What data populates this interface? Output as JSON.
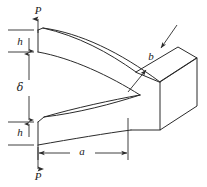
{
  "figure": {
    "type": "engineering-diagram",
    "background_color": "#ffffff",
    "line_color": "#2b2b2b",
    "width": 207,
    "height": 187
  },
  "labels": {
    "load_top": "P",
    "load_bottom": "P",
    "height_top": "h",
    "height_bottom": "h",
    "gap": "δ",
    "length": "a",
    "depth": "b"
  },
  "annotations": [
    {
      "name": "load-top",
      "text": "P",
      "x": 38,
      "y": 11,
      "meaning": "applied force upward at top arm"
    },
    {
      "name": "arm-height-top",
      "text": "h",
      "x": 20,
      "y": 42,
      "meaning": "thickness of upper arm"
    },
    {
      "name": "gap-delta",
      "text": "δ",
      "x": 20,
      "y": 88,
      "meaning": "opening displacement between arms"
    },
    {
      "name": "arm-height-bottom",
      "text": "h",
      "x": 20,
      "y": 133,
      "meaning": "thickness of lower arm"
    },
    {
      "name": "crack-length",
      "text": "a",
      "x": 82,
      "y": 153,
      "meaning": "slit / crack length along beam"
    },
    {
      "name": "depth",
      "text": "b",
      "x": 151,
      "y": 57,
      "meaning": "out-of-plane depth of block"
    },
    {
      "name": "load-bottom",
      "text": "P",
      "x": 38,
      "y": 177,
      "meaning": "applied force downward at bottom arm"
    }
  ],
  "dimensions": {
    "vertical_stack": [
      {
        "label": "h",
        "from_y": 30,
        "to_y": 52
      },
      {
        "label": "δ",
        "from_y": 52,
        "to_y": 122
      },
      {
        "label": "h",
        "from_y": 122,
        "to_y": 145
      }
    ],
    "horizontal": [
      {
        "label": "a",
        "from_x": 38,
        "to_x": 128,
        "y": 153
      }
    ],
    "leaders": [
      {
        "label": "b",
        "target": "top-face"
      },
      {
        "label": "b",
        "target": "front-face"
      }
    ]
  },
  "forces": [
    {
      "label": "P",
      "direction": "up",
      "at_x": 38,
      "tip_y": 18,
      "tail_y": 32
    },
    {
      "label": "P",
      "direction": "down",
      "at_x": 38,
      "tip_y": 170,
      "tail_y": 148
    }
  ]
}
